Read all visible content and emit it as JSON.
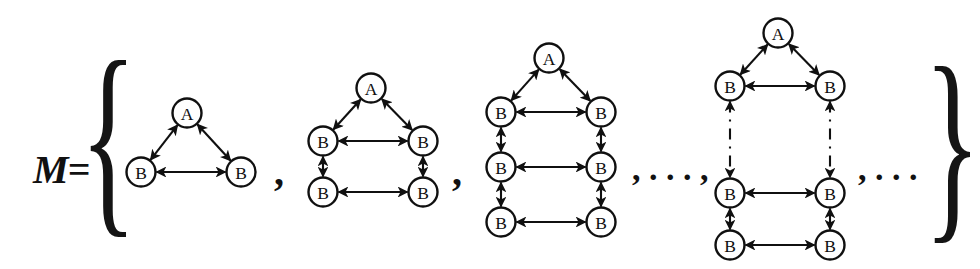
{
  "figure": {
    "title_label": "M=",
    "open_brace": "{",
    "close_brace": "}",
    "separator_comma": ",",
    "ellipsis_mid": ",  .  .  . ,",
    "ellipsis_end": ", . . .",
    "node_a_label": "A",
    "node_b_label": "B",
    "ink_color": "#101010",
    "background_color": "#ffffff"
  },
  "graphs": [
    {
      "name": "graph-1",
      "apex": {
        "label": "A",
        "cx": 187,
        "cy": 113
      },
      "rows": [
        {
          "left": {
            "label": "B",
            "cx": 141,
            "cy": 172
          },
          "right": {
            "label": "B",
            "cx": 241,
            "cy": 172
          },
          "dashed_above": false
        }
      ],
      "b_count": 2,
      "row_count": 1
    },
    {
      "name": "graph-2",
      "apex": {
        "label": "A",
        "cx": 371,
        "cy": 88
      },
      "rows": [
        {
          "left": {
            "label": "B",
            "cx": 323,
            "cy": 141
          },
          "right": {
            "label": "B",
            "cx": 423,
            "cy": 141
          },
          "dashed_above": false
        },
        {
          "left": {
            "label": "B",
            "cx": 323,
            "cy": 192
          },
          "right": {
            "label": "B",
            "cx": 423,
            "cy": 192
          },
          "dashed_above": false
        }
      ],
      "b_count": 4,
      "row_count": 2
    },
    {
      "name": "graph-3",
      "apex": {
        "label": "A",
        "cx": 549,
        "cy": 58
      },
      "rows": [
        {
          "left": {
            "label": "B",
            "cx": 501,
            "cy": 112
          },
          "right": {
            "label": "B",
            "cx": 601,
            "cy": 112
          },
          "dashed_above": false
        },
        {
          "left": {
            "label": "B",
            "cx": 501,
            "cy": 167
          },
          "right": {
            "label": "B",
            "cx": 601,
            "cy": 167
          },
          "dashed_above": false
        },
        {
          "left": {
            "label": "B",
            "cx": 501,
            "cy": 222
          },
          "right": {
            "label": "B",
            "cx": 601,
            "cy": 222
          },
          "dashed_above": false
        }
      ],
      "b_count": 6,
      "row_count": 3
    },
    {
      "name": "graph-n",
      "apex": {
        "label": "A",
        "cx": 778,
        "cy": 33
      },
      "rows": [
        {
          "left": {
            "label": "B",
            "cx": 730,
            "cy": 86
          },
          "right": {
            "label": "B",
            "cx": 830,
            "cy": 86
          },
          "dashed_above": false
        },
        {
          "left": {
            "label": "B",
            "cx": 730,
            "cy": 193
          },
          "right": {
            "label": "B",
            "cx": 830,
            "cy": 193
          },
          "dashed_above": true
        },
        {
          "left": {
            "label": "B",
            "cx": 730,
            "cy": 245
          },
          "right": {
            "label": "B",
            "cx": 830,
            "cy": 245
          },
          "dashed_above": false
        }
      ],
      "b_count": 6,
      "row_count": 3
    }
  ],
  "annotations": {
    "m_label_x": 33,
    "m_label_y": 148,
    "open_brace_x": 86,
    "open_brace_y": 52,
    "close_brace_x": 928,
    "close_brace_y": 58,
    "comma1_x": 276,
    "comma1_y": 168,
    "comma2_x": 455,
    "comma2_y": 168,
    "mid_ellipsis_x": 634,
    "mid_ellipsis_y": 168,
    "end_ellipsis_x": 862,
    "end_ellipsis_y": 168
  }
}
